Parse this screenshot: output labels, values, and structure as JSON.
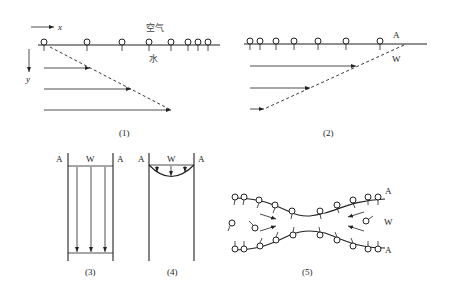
{
  "figure": {
    "panels": [
      {
        "id": "1",
        "caption": "(1)",
        "axis_x_label": "x",
        "axis_y_label": "y",
        "label_air": "空气",
        "label_water": "水",
        "description": "Air-water interface with surfactant molecules increasing in density to the right; velocity profile arrows increase with depth (dashed envelope)"
      },
      {
        "id": "2",
        "caption": "(2)",
        "label_air": "A",
        "label_water": "W",
        "description": "Surfactant molecules denser on the left; velocity arrows decrease with depth (dashed envelope)"
      },
      {
        "id": "3",
        "caption": "(3)",
        "label_left": "A",
        "label_center": "W",
        "label_right": "A",
        "description": "Liquid film between two air phases with uniform downward flow"
      },
      {
        "id": "4",
        "caption": "(4)",
        "label_left": "A",
        "label_center": "W",
        "label_right": "A",
        "description": "Liquid film with parabolic downward flow profile at top"
      },
      {
        "id": "5",
        "caption": "(5)",
        "label_top": "A",
        "label_middle": "W",
        "label_bottom": "A",
        "description": "Thinning liquid film with surfactant molecules at both interfaces, flow arrows converging toward center"
      }
    ]
  }
}
